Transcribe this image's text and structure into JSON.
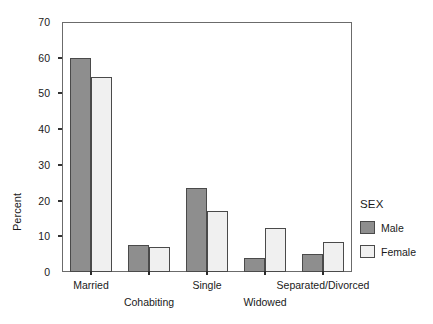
{
  "chart_data": {
    "type": "bar",
    "title": "",
    "subtitle": "",
    "xlabel": "",
    "ylabel": "Percent",
    "categories": [
      "Married",
      "Cohabiting",
      "Single",
      "Widowed",
      "Separated/Divorced"
    ],
    "series": [
      {
        "name": "Male",
        "values": [
          60.0,
          7.5,
          23.5,
          4.0,
          5.0
        ],
        "color": "#8e8e8e"
      },
      {
        "name": "Female",
        "values": [
          54.5,
          7.0,
          17.2,
          12.2,
          8.5
        ],
        "color": "#f0f0f0"
      }
    ],
    "ylim": [
      0,
      70
    ],
    "yticks": [
      0,
      10,
      20,
      30,
      40,
      50,
      60,
      70
    ],
    "ytick_labels": [
      "0",
      "10",
      "20",
      "30",
      "40",
      "50",
      "60",
      "70"
    ],
    "grid": false,
    "legend": {
      "title": "SEX",
      "position": "right",
      "entries": [
        {
          "label": "Male",
          "color": "#8e8e8e"
        },
        {
          "label": "Female",
          "color": "#f0f0f0"
        }
      ]
    },
    "axis_color": "#6b6b6b",
    "bar_edge_color": "#4a4a4a",
    "background": "#ffffff"
  }
}
